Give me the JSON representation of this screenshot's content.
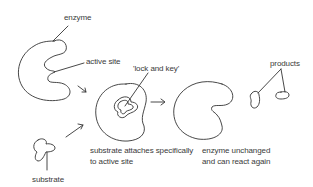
{
  "diagram": {
    "labels": {
      "enzyme": "enzyme",
      "active_site": "active site",
      "lock_and_key": "'lock and key'",
      "products": "products",
      "substrate": "substrate",
      "attach_line1": "substrate attaches specifically",
      "attach_line2": "to active site",
      "unchanged_line1": "enzyme unchanged",
      "unchanged_line2": "and can react again"
    },
    "colors": {
      "stroke": "#333333",
      "text": "#3a3a3a",
      "background": "#ffffff"
    }
  }
}
